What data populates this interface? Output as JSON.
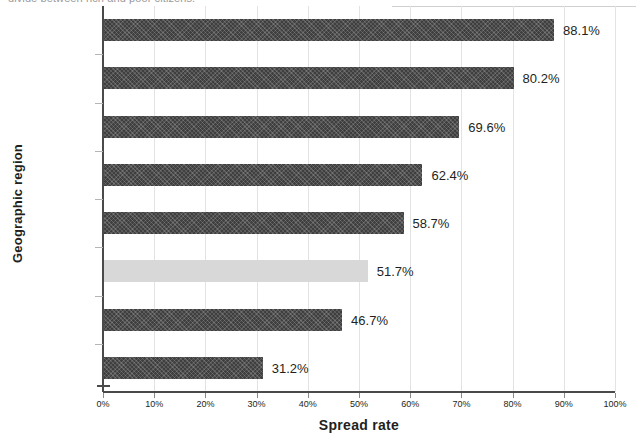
{
  "caption_clipped": "divide between rich and poor citizens.",
  "chart_data": {
    "type": "bar",
    "orientation": "horizontal",
    "title": "",
    "xlabel": "Spread rate",
    "ylabel": "Geographic region",
    "xlim": [
      0,
      100
    ],
    "xticks": [
      "0%",
      "10%",
      "20%",
      "30%",
      "40%",
      "50%",
      "60%",
      "70%",
      "80%",
      "90%",
      "100%"
    ],
    "xtick_values": [
      0,
      10,
      20,
      30,
      40,
      50,
      60,
      70,
      80,
      90,
      100
    ],
    "grid": "vertical",
    "legend": "none",
    "categories": [
      "North America",
      "Europe",
      "Australia /\nOceania",
      "Latin America /\nCaribbean",
      "Middle East",
      "World average",
      "Asia",
      "Africa"
    ],
    "values": [
      88.1,
      80.2,
      69.6,
      62.4,
      58.7,
      51.7,
      46.7,
      31.2
    ],
    "value_labels": [
      "88.1%",
      "80.2%",
      "69.6%",
      "62.4%",
      "58.7%",
      "51.7%",
      "46.7%",
      "31.2%"
    ],
    "highlight_index": 5,
    "colors": {
      "bar": "#3f3f3f",
      "bar_highlight": "#d8d8d8",
      "axis": "#4a4a4a",
      "gridline": "#e3e3e3",
      "text": "#231f20"
    }
  }
}
